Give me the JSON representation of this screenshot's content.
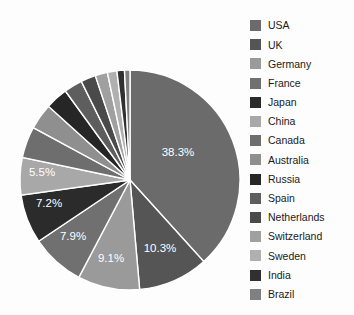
{
  "chart_data": {
    "type": "pie",
    "title": "",
    "legend_position": "right",
    "grid": false,
    "start_angle_deg": 90,
    "direction": "clockwise",
    "categories": [
      "USA",
      "UK",
      "Germany",
      "France",
      "Japan",
      "China",
      "Canada",
      "Australia",
      "Russia",
      "Spain",
      "Netherlands",
      "Switzerland",
      "Sweden",
      "India",
      "Brazil"
    ],
    "values": [
      38.3,
      10.3,
      9.1,
      7.9,
      7.2,
      5.5,
      4.6,
      3.8,
      3.3,
      2.7,
      2.2,
      1.8,
      1.4,
      1.1,
      0.8
    ],
    "labels_shown": [
      "38.3%",
      "10.3%",
      "9.1%",
      "7.9%",
      "7.2%",
      "5.5%",
      "",
      "",
      "",
      "",
      "",
      "",
      "",
      "",
      ""
    ],
    "colors": [
      "#6b6b6b",
      "#555555",
      "#9a9a9a",
      "#707070",
      "#2b2b2b",
      "#a8a8a8",
      "#6e6e6e",
      "#8f8f8f",
      "#262626",
      "#5e5e5e",
      "#4a4a4a",
      "#a0a0a0",
      "#b0b0b0",
      "#303030",
      "#808080"
    ],
    "slice_label_color": "#ffffff",
    "slice_border_color": "#ffffff",
    "background_color": "#fdfdfd"
  },
  "pie": {
    "center_x": 130,
    "center_y": 180,
    "radius": 110,
    "slices": [
      {
        "name": "USA",
        "percent": 38.3,
        "label": "38.3%",
        "color": "#6b6b6b",
        "label_x": 178,
        "label_y": 156
      },
      {
        "name": "UK",
        "percent": 10.3,
        "label": "10.3%",
        "color": "#555555",
        "label_x": 160,
        "label_y": 252
      },
      {
        "name": "Germany",
        "percent": 9.1,
        "label": "9.1%",
        "color": "#9a9a9a",
        "label_x": 111,
        "label_y": 262
      },
      {
        "name": "France",
        "percent": 7.9,
        "label": "7.9%",
        "color": "#707070",
        "label_x": 73,
        "label_y": 240
      },
      {
        "name": "Japan",
        "percent": 7.2,
        "label": "7.2%",
        "color": "#2b2b2b",
        "label_x": 49,
        "label_y": 207
      },
      {
        "name": "China",
        "percent": 5.5,
        "label": "5.5%",
        "color": "#a8a8a8",
        "label_x": 42,
        "label_y": 176
      },
      {
        "name": "Canada",
        "percent": 4.6,
        "label": "",
        "color": "#6e6e6e",
        "label_x": 0,
        "label_y": 0
      },
      {
        "name": "Australia",
        "percent": 3.8,
        "label": "",
        "color": "#8f8f8f",
        "label_x": 0,
        "label_y": 0
      },
      {
        "name": "Russia",
        "percent": 3.3,
        "label": "",
        "color": "#262626",
        "label_x": 0,
        "label_y": 0
      },
      {
        "name": "Spain",
        "percent": 2.7,
        "label": "",
        "color": "#5e5e5e",
        "label_x": 0,
        "label_y": 0
      },
      {
        "name": "Netherlands",
        "percent": 2.2,
        "label": "",
        "color": "#4a4a4a",
        "label_x": 0,
        "label_y": 0
      },
      {
        "name": "Switzerland",
        "percent": 1.8,
        "label": "",
        "color": "#a0a0a0",
        "label_x": 0,
        "label_y": 0
      },
      {
        "name": "Sweden",
        "percent": 1.4,
        "label": "",
        "color": "#b0b0b0",
        "label_x": 0,
        "label_y": 0
      },
      {
        "name": "India",
        "percent": 1.1,
        "label": "",
        "color": "#303030",
        "label_x": 0,
        "label_y": 0
      },
      {
        "name": "Brazil",
        "percent": 0.8,
        "label": "",
        "color": "#808080",
        "label_x": 0,
        "label_y": 0
      }
    ]
  },
  "legend": {
    "items": [
      {
        "label": "USA",
        "color": "#6b6b6b"
      },
      {
        "label": "UK",
        "color": "#555555"
      },
      {
        "label": "Germany",
        "color": "#9a9a9a"
      },
      {
        "label": "France",
        "color": "#707070"
      },
      {
        "label": "Japan",
        "color": "#2b2b2b"
      },
      {
        "label": "China",
        "color": "#a8a8a8"
      },
      {
        "label": "Canada",
        "color": "#6e6e6e"
      },
      {
        "label": "Australia",
        "color": "#8f8f8f"
      },
      {
        "label": "Russia",
        "color": "#262626"
      },
      {
        "label": "Spain",
        "color": "#5e5e5e"
      },
      {
        "label": "Netherlands",
        "color": "#4a4a4a"
      },
      {
        "label": "Switzerland",
        "color": "#a0a0a0"
      },
      {
        "label": "Sweden",
        "color": "#b0b0b0"
      },
      {
        "label": "India",
        "color": "#303030"
      },
      {
        "label": "Brazil",
        "color": "#808080"
      }
    ]
  }
}
